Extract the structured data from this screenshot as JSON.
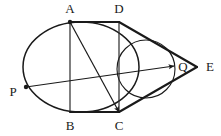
{
  "figure": {
    "kind": "geometry-diagram",
    "width": 221,
    "height": 136,
    "background_color": "#ffffff",
    "stroke_color": "#1a1a1a",
    "thin_stroke_color": "#2b2b2b",
    "labels": {
      "a": "A",
      "b": "B",
      "c": "C",
      "d": "D",
      "e": "E",
      "p": "P",
      "q": "Q"
    },
    "label_positions": {
      "a": {
        "x": 70,
        "y": 10
      },
      "b": {
        "x": 70,
        "y": 127
      },
      "c": {
        "x": 119,
        "y": 127
      },
      "d": {
        "x": 119,
        "y": 10
      },
      "e": {
        "x": 210,
        "y": 68
      },
      "p": {
        "x": 13,
        "y": 93
      },
      "q": {
        "x": 183,
        "y": 68
      }
    },
    "points": {
      "a": {
        "x": 70,
        "y": 22
      },
      "b": {
        "x": 70,
        "y": 112
      },
      "c": {
        "x": 119,
        "y": 112
      },
      "d": {
        "x": 119,
        "y": 22
      },
      "e": {
        "x": 197,
        "y": 67
      },
      "p": {
        "x": 26,
        "y": 87
      },
      "q": {
        "x": 174,
        "y": 66
      }
    },
    "large_circle": {
      "cx": 81,
      "cy": 67,
      "rx": 58,
      "ry": 45
    },
    "small_circle": {
      "cx": 146,
      "cy": 69,
      "rx": 29,
      "ry": 29
    },
    "segments": [
      {
        "name": "segment-ad",
        "from": "a",
        "to": "d",
        "weight": "thick"
      },
      {
        "name": "segment-ab",
        "from": "a",
        "to": "b",
        "weight": "thin"
      },
      {
        "name": "segment-dc",
        "from": "d",
        "to": "c",
        "weight": "thin"
      },
      {
        "name": "segment-bc",
        "from": "b",
        "to": "c",
        "weight": "thick"
      },
      {
        "name": "segment-de",
        "from": "d",
        "to": "e",
        "weight": "thick"
      },
      {
        "name": "segment-ce",
        "from": "c",
        "to": "e",
        "weight": "thick"
      }
    ],
    "arrows": [
      {
        "name": "arrow-a-to-c",
        "from": "a",
        "to": "c"
      },
      {
        "name": "arrow-p-to-q",
        "from": "p",
        "to": "q"
      }
    ],
    "dots": [
      {
        "name": "vertex-dot-a",
        "at": "a"
      },
      {
        "name": "vertex-dot-p",
        "at": "p"
      }
    ]
  }
}
